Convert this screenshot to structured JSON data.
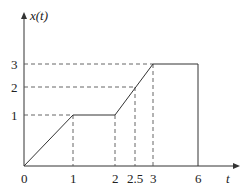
{
  "diagram": {
    "type": "piecewise-function-plot",
    "y_axis_label": "x(t)",
    "x_axis_label": "t",
    "x_ticks": [
      "0",
      "1",
      "2",
      "2.5",
      "3",
      "6"
    ],
    "y_ticks": [
      "1",
      "2",
      "3"
    ],
    "points": [
      {
        "t": 0,
        "x": 0
      },
      {
        "t": 1,
        "x": 1
      },
      {
        "t": 2,
        "x": 1
      },
      {
        "t": 3,
        "x": 3
      },
      {
        "t": 6,
        "x": 3
      },
      {
        "t": 6,
        "x": 0
      }
    ],
    "guides": [
      {
        "type": "horizontal",
        "value": 1,
        "to_t": 1
      },
      {
        "type": "horizontal",
        "value": 2,
        "to_t": 2.5
      },
      {
        "type": "horizontal",
        "value": 3,
        "to_t": 3
      },
      {
        "type": "vertical",
        "t": 1
      },
      {
        "type": "vertical",
        "t": 2
      },
      {
        "type": "vertical",
        "t": 2.5
      },
      {
        "type": "vertical",
        "t": 3
      }
    ],
    "colors": {
      "line": "#333333",
      "guide": "#555555"
    }
  }
}
